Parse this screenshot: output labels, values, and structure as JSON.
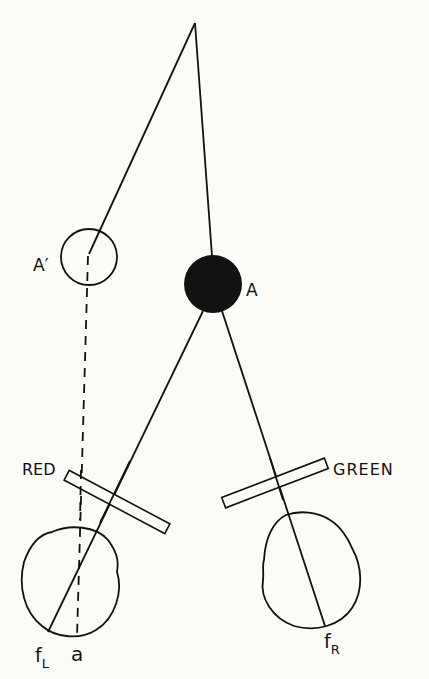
{
  "diagram": {
    "type": "binocular anaglyph disparity diagram",
    "labels": {
      "object_real": "A",
      "object_perceived": "A′",
      "filter_left": "RED",
      "filter_right": "GREEN",
      "fovea_left_main": "f",
      "fovea_left_sub": "L",
      "retinal_point": "a",
      "fovea_right_main": "f",
      "fovea_right_sub": "R"
    },
    "elements": [
      {
        "id": "apex-point",
        "kind": "point",
        "x": 195,
        "y": 23
      },
      {
        "id": "perceived-object",
        "kind": "open-circle",
        "label": "A′",
        "cx": 89,
        "cy": 257,
        "r": 28
      },
      {
        "id": "real-object",
        "kind": "filled-circle",
        "label": "A",
        "cx": 213,
        "cy": 284,
        "r": 29
      },
      {
        "id": "red-filter",
        "kind": "filter-bar",
        "label": "RED"
      },
      {
        "id": "green-filter",
        "kind": "filter-bar",
        "label": "GREEN"
      },
      {
        "id": "left-eye",
        "kind": "eye",
        "fovea": "fL",
        "retinal_point": "a"
      },
      {
        "id": "right-eye",
        "kind": "eye",
        "fovea": "fR"
      }
    ],
    "colors": {
      "background": "#fbfbf7",
      "ink": "#111111"
    }
  }
}
